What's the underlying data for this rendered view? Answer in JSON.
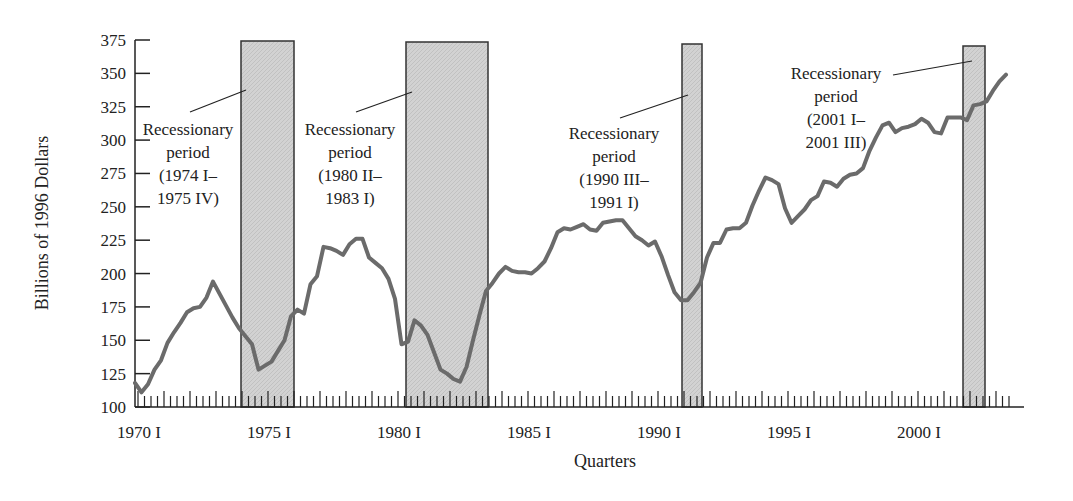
{
  "chart_data": {
    "type": "line",
    "title": "",
    "xlabel": "Quarters",
    "ylabel": "Billions of 1996 Dollars",
    "ylim": [
      100,
      375
    ],
    "yticks": [
      100,
      125,
      150,
      175,
      200,
      225,
      250,
      275,
      300,
      325,
      350,
      375
    ],
    "xlim": [
      "1970 I",
      "2003 II"
    ],
    "xtick_labels": [
      "1970 I",
      "1975 I",
      "1980 I",
      "1985 I",
      "1990 I",
      "1995 I",
      "2000 I"
    ],
    "grid": false,
    "legend": null,
    "line_color": "#6b6b6b",
    "shade_color": "#cfcfcf",
    "series": [
      {
        "name": "Real investment (Billions of 1996 Dollars)",
        "x_start_year": 1970,
        "x_step": "quarter",
        "values": [
          118,
          111,
          117,
          128,
          135,
          148,
          156,
          163,
          171,
          174,
          175,
          182,
          194,
          185,
          176,
          167,
          159,
          153,
          147,
          128,
          131,
          134,
          142,
          150,
          168,
          173,
          170,
          192,
          198,
          220,
          219,
          217,
          214,
          222,
          226,
          226,
          212,
          208,
          204,
          196,
          181,
          147,
          149,
          165,
          161,
          154,
          141,
          128,
          125,
          121,
          119,
          130,
          150,
          169,
          187,
          193,
          200,
          205,
          202,
          201,
          201,
          200,
          204,
          209,
          219,
          231,
          234,
          233,
          235,
          237,
          233,
          232,
          238,
          239,
          240,
          240,
          234,
          228,
          225,
          221,
          224,
          213,
          199,
          186,
          180,
          180,
          186,
          193,
          212,
          223,
          223,
          233,
          234,
          234,
          238,
          251,
          262,
          272,
          270,
          267,
          249,
          238,
          243,
          248,
          255,
          258,
          269,
          268,
          265,
          271,
          274,
          275,
          279,
          292,
          302,
          311,
          313,
          306,
          309,
          310,
          312,
          316,
          313,
          306,
          305,
          317,
          317,
          317,
          315,
          326,
          327,
          329,
          337,
          344,
          349
        ]
      }
    ],
    "recessions": [
      {
        "label": "Recessionary period",
        "range": "(1974 I–",
        "range2": "1975 IV)",
        "start": "1974 I",
        "end": "1975 IV"
      },
      {
        "label": "Recessionary period",
        "range": "(1980 II–",
        "range2": "1983 I)",
        "start": "1980 II",
        "end": "1983 I"
      },
      {
        "label": "Recessionary period",
        "range": "(1990 III–",
        "range2": "1991 I)",
        "start": "1990 III",
        "end": "1991 I"
      },
      {
        "label": "Recessionary period",
        "range": "(2001 I–",
        "range2": "2001 III)",
        "start": "2001 I",
        "end": "2001 III"
      }
    ]
  },
  "annotations": [
    {
      "line1": "Recessionary",
      "line2": "period",
      "line3": "(1974 I–",
      "line4": "1975 IV)"
    },
    {
      "line1": "Recessionary",
      "line2": "period",
      "line3": "(1980 II–",
      "line4": "1983 I)"
    },
    {
      "line1": "Recessionary",
      "line2": "period",
      "line3": "(1990 III–",
      "line4": "1991 I)"
    },
    {
      "line1": "Recessionary",
      "line2": "period",
      "line3": "(2001 I–",
      "line4": "2001 III)"
    }
  ]
}
